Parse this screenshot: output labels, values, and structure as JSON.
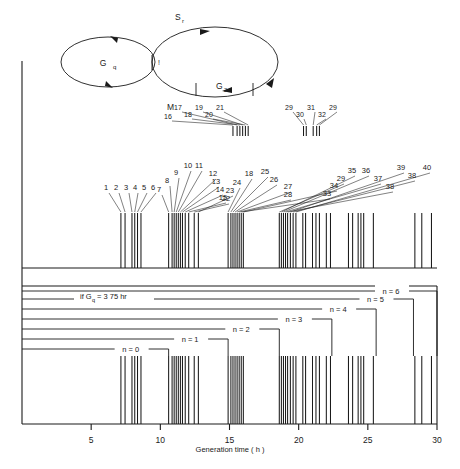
{
  "figure": {
    "axis_title": "Generation time ( h )",
    "x_ticks": [
      5,
      10,
      15,
      20,
      25,
      30
    ],
    "x_domain": [
      0,
      30
    ],
    "gq_note": "if G",
    "gq_note_sub": "q",
    "gq_note_rest": "=  3 75 hr"
  },
  "cycle_diagram": {
    "phase_gq": "G",
    "phase_gq_sub": "q",
    "phase_s": "S",
    "phase_s_sub": "r",
    "phase_g2": "G",
    "phase_g2_sub": "2",
    "phase_m": "M",
    "marker_tick": "!"
  },
  "n_labels": [
    {
      "text": "n = 0"
    },
    {
      "text": "n = 1"
    },
    {
      "text": "n = 2"
    },
    {
      "text": "n = 3"
    },
    {
      "text": "n = 4"
    },
    {
      "text": "n = 5"
    },
    {
      "text": "n = 6"
    }
  ],
  "spike_labels_upper": [
    "16",
    "17",
    "18",
    "19",
    "20",
    "21",
    "29",
    "30",
    "31",
    "32",
    "29"
  ],
  "spike_labels_main": [
    "1",
    "2",
    "3",
    "4",
    "5",
    "6",
    "7",
    "8",
    "9",
    "10",
    "11",
    "12",
    "13",
    "14",
    "15",
    "22",
    "23",
    "24",
    "18",
    "25",
    "26",
    "27",
    "28",
    "33",
    "34",
    "29",
    "35",
    "36",
    "37",
    "38",
    "39",
    "38",
    "40"
  ],
  "chart_data": {
    "type": "scatter",
    "title": "",
    "xlabel": "Generation time ( h )",
    "ylabel": "",
    "xlim": [
      0,
      30
    ],
    "grid": false,
    "legend": "none",
    "series": [
      {
        "name": "upper-ticks",
        "comment": "short tick marks above the main spike row",
        "x": [
          15.25,
          15.55,
          15.75,
          15.95,
          16.15,
          16.35,
          20.35,
          20.55,
          21.05,
          21.3,
          21.5
        ]
      },
      {
        "name": "main-spikes",
        "comment": "vertical event lines, generation time in hours",
        "x": [
          7.15,
          7.45,
          7.95,
          8.15,
          8.35,
          8.6,
          10.6,
          10.85,
          11.0,
          11.15,
          11.3,
          11.45,
          11.6,
          11.8,
          12.05,
          12.45,
          12.75,
          14.9,
          15.1,
          15.25,
          15.4,
          15.55,
          15.7,
          15.85,
          16.0,
          18.6,
          18.75,
          18.9,
          19.05,
          19.2,
          19.4,
          19.6,
          19.8,
          20.3,
          20.5,
          21.0,
          21.25,
          21.5,
          22.0,
          22.3,
          23.6,
          23.9,
          24.3,
          24.5,
          24.7,
          25.4,
          28.4,
          28.9,
          29.6
        ]
      }
    ],
    "n_brackets": [
      {
        "label": "n = 0",
        "end_x": 10.6
      },
      {
        "label": "n = 1",
        "end_x": 14.9
      },
      {
        "label": "n = 2",
        "end_x": 18.6
      },
      {
        "label": "n = 3",
        "end_x": 22.4
      },
      {
        "label": "n = 4",
        "end_x": 25.6
      },
      {
        "label": "n = 5",
        "end_x": 28.3
      },
      {
        "label": "n = 6",
        "end_x": 30.0
      }
    ]
  }
}
